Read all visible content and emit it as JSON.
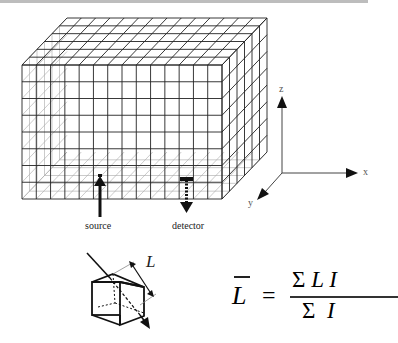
{
  "figure": {
    "type": "voxel-grid diagram",
    "grid": {
      "columns_x": 14,
      "rows_z": 8,
      "depth_y": 6
    },
    "labels": {
      "source": "source",
      "detector": "detector",
      "axis_x": "x",
      "axis_y": "y",
      "axis_z": "z",
      "path_length": "L"
    },
    "formula": {
      "lhs": "L",
      "equals": "=",
      "numerator": "Σ L I",
      "numerator_sigma": "Σ",
      "numerator_terms": "L I",
      "denominator_sigma": "Σ",
      "denominator_terms": "I"
    },
    "colors": {
      "line": "#222222",
      "grid_light": "#9a9a9a",
      "background": "#ffffff"
    }
  }
}
